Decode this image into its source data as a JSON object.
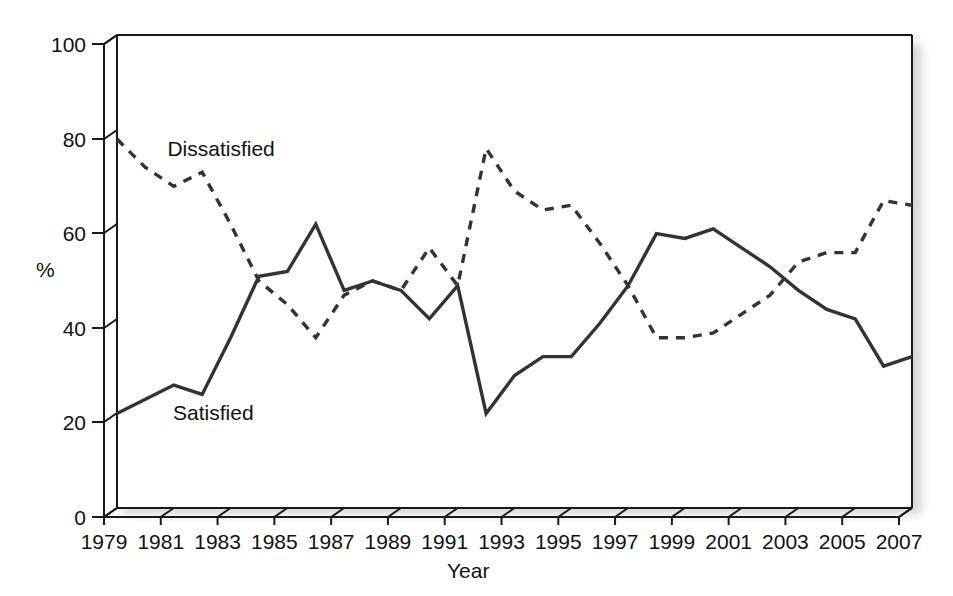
{
  "chart_data": {
    "type": "line",
    "title": "",
    "xlabel": "Year",
    "ylabel": "%",
    "ylim": [
      0,
      100
    ],
    "xlim": [
      1979,
      2007
    ],
    "ytick_labels": [
      "0",
      "20",
      "40",
      "60",
      "80",
      "100"
    ],
    "yticks": [
      0,
      20,
      40,
      60,
      80,
      100
    ],
    "xtick_labels": [
      "1979",
      "1981",
      "1983",
      "1985",
      "1987",
      "1989",
      "1991",
      "1993",
      "1995",
      "1997",
      "1999",
      "2001",
      "2003",
      "2005",
      "2007"
    ],
    "xticks": [
      1979,
      1981,
      1983,
      1985,
      1987,
      1989,
      1991,
      1993,
      1995,
      1997,
      1999,
      2001,
      2003,
      2005,
      2007
    ],
    "grid": false,
    "legend_position": "inline-annotations",
    "x": [
      1979,
      1980,
      1981,
      1982,
      1983,
      1984,
      1985,
      1986,
      1987,
      1988,
      1989,
      1990,
      1991,
      1992,
      1993,
      1994,
      1995,
      1996,
      1997,
      1998,
      1999,
      2000,
      2001,
      2002,
      2003,
      2004,
      2005,
      2006,
      2007
    ],
    "series": [
      {
        "name": "Dissatisfied",
        "style": "dashed",
        "color": "#333333",
        "values": [
          78,
          72,
          68,
          71,
          60,
          48,
          43,
          36,
          45,
          48,
          46,
          55,
          47,
          76,
          67,
          63,
          64,
          56,
          47,
          36,
          36,
          37,
          41,
          45,
          52,
          54,
          54,
          65,
          64
        ]
      },
      {
        "name": "Satisfied",
        "style": "solid",
        "color": "#333333",
        "values": [
          20,
          23,
          26,
          24,
          36,
          49,
          50,
          60,
          46,
          48,
          46,
          40,
          47,
          20,
          28,
          32,
          32,
          39,
          47,
          58,
          57,
          59,
          55,
          51,
          46,
          42,
          40,
          30,
          32
        ]
      }
    ],
    "annotations": [
      {
        "text": "Dissatisfied",
        "x": 1980.0,
        "y": 76
      },
      {
        "text": "Satisfied",
        "x": 1980.2,
        "y": 20
      }
    ]
  },
  "axes": {
    "y_axis_name": "percent-axis",
    "x_axis_name": "year-axis"
  }
}
